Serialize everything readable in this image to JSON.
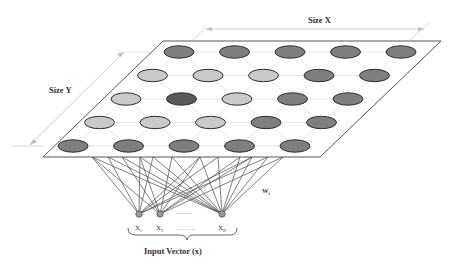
{
  "labels": {
    "size_x": "Size X",
    "size_y": "Size Y",
    "weight": "W",
    "weight_sub": "i",
    "input_vector": "Input Vector (x)",
    "inputs": [
      {
        "base": "X",
        "sub": "1"
      },
      {
        "base": "X",
        "sub": "2"
      },
      {
        "base": "X",
        "sub": "D"
      }
    ],
    "ellipsis": "..........."
  },
  "colors": {
    "light": "#c9c9c9",
    "medium": "#7f7f7f",
    "dark": "#595959",
    "stroke": "#2e2e2e",
    "plane_stroke": "#444444",
    "grid": "#d6d6d6",
    "arrow": "#c8c8c8",
    "connection": "#4a4a4a",
    "node": "#9a9a9a"
  },
  "grid": {
    "rows": 5,
    "cols": 5,
    "node_shades": [
      [
        "medium",
        "medium",
        "medium",
        "medium",
        "medium"
      ],
      [
        "light",
        "light",
        "light",
        "medium",
        "medium"
      ],
      [
        "light",
        "dark",
        "light",
        "medium",
        "medium"
      ],
      [
        "light",
        "light",
        "light",
        "medium",
        "medium"
      ],
      [
        "medium",
        "medium",
        "medium",
        "medium",
        "medium"
      ]
    ]
  },
  "plane": {
    "corners": {
      "tl": [
        163,
        41
      ],
      "tr": [
        441,
        41
      ],
      "br": [
        320,
        157
      ],
      "bl": [
        43,
        157
      ]
    }
  },
  "input_nodes": [
    {
      "x": 139,
      "y": 214
    },
    {
      "x": 160,
      "y": 214
    },
    {
      "x": 222,
      "y": 214
    }
  ],
  "connection_anchors_x": [
    92,
    108,
    122,
    140,
    153,
    172,
    200,
    218,
    240,
    252,
    268,
    283
  ]
}
